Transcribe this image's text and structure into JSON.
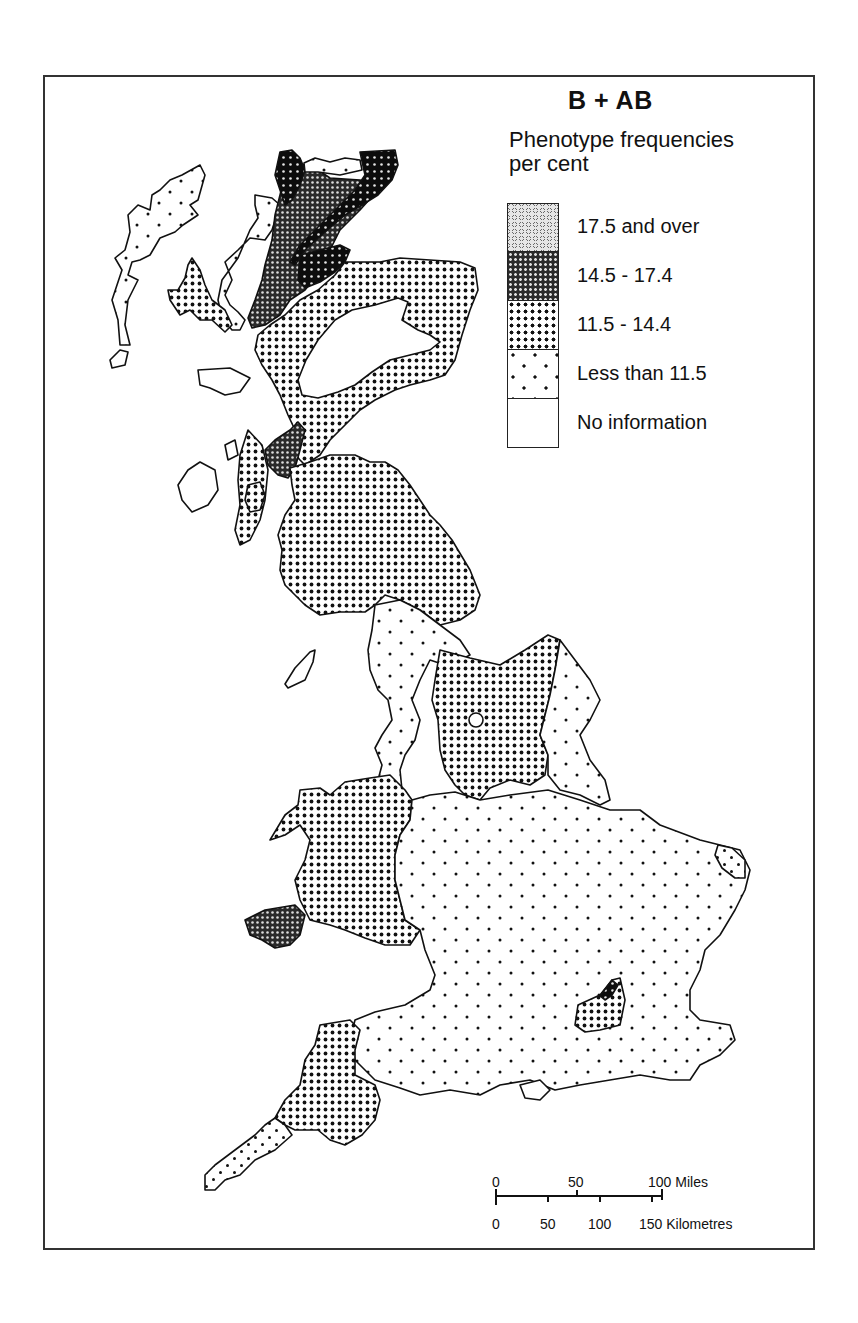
{
  "map": {
    "title": "B + AB",
    "subtitle": "Phenotype frequencies per cent",
    "region": "Great Britain",
    "legend": [
      {
        "label": "17.5 and over",
        "pattern": "very-dense-dark",
        "class": "17.5+"
      },
      {
        "label": "14.5 - 17.4",
        "pattern": "dense-dark",
        "class": "14.5-17.4"
      },
      {
        "label": "11.5 - 14.4",
        "pattern": "dense-dots",
        "class": "11.5-14.4"
      },
      {
        "label": "Less than 11.5",
        "pattern": "sparse-dots",
        "class": "<11.5"
      },
      {
        "label": "No information",
        "pattern": "blank",
        "class": "none"
      }
    ],
    "regions": [
      {
        "name": "North-west Scottish Highlands (Sutherland)",
        "class": "17.5+"
      },
      {
        "name": "Caithness / east Sutherland coast",
        "class": "17.5+"
      },
      {
        "name": "Wester Ross / west Highlands",
        "class": "14.5-17.4"
      },
      {
        "name": "Argyll / Clyde area",
        "class": "14.5-17.4"
      },
      {
        "name": "Pembrokeshire",
        "class": "14.5-17.4"
      },
      {
        "name": "Small area north-west of London",
        "class": "17.5+"
      },
      {
        "name": "North-east Scotland",
        "class": "11.5-14.4"
      },
      {
        "name": "Southern Scotland & north-east England",
        "class": "11.5-14.4"
      },
      {
        "name": "Yorkshire / Pennines",
        "class": "11.5-14.4"
      },
      {
        "name": "Wales",
        "class": "11.5-14.4"
      },
      {
        "name": "Devon / east Cornwall",
        "class": "11.5-14.4"
      },
      {
        "name": "Around London (Home Counties pocket)",
        "class": "11.5-14.4"
      },
      {
        "name": "Norfolk coast pocket",
        "class": "11.5-14.4"
      },
      {
        "name": "Outer Hebrides & north-west coast",
        "class": "<11.5"
      },
      {
        "name": "Lancashire / Cumbria coast",
        "class": "<11.5"
      },
      {
        "name": "Midlands, East Anglia & southern England",
        "class": "<11.5"
      },
      {
        "name": "West Cornwall",
        "class": "<11.5"
      },
      {
        "name": "Central Highlands (Grampians)",
        "class": "none"
      },
      {
        "name": "Inner Hebrides (Mull, Jura, Islay) & Isle of Man",
        "class": "none"
      }
    ]
  },
  "scale": {
    "miles_ticks": [
      "0",
      "50",
      "100 Miles"
    ],
    "km_ticks": [
      "0",
      "50",
      "100",
      "150 Kilometres"
    ]
  }
}
